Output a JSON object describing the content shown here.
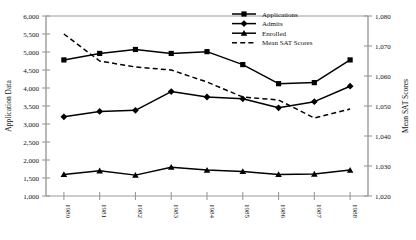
{
  "chart_data": {
    "type": "line",
    "title": "",
    "xlabel": "",
    "ylabel": "Application Data",
    "y2label": "Mean SAT Scores",
    "grid": false,
    "legend_position": "top-right",
    "categories": [
      "1980",
      "1981",
      "1982",
      "1983",
      "1984",
      "1985",
      "1986",
      "1987",
      "1988"
    ],
    "ylim": [
      1000,
      6000
    ],
    "y_ticks": [
      "1,000",
      "1,500",
      "2,000",
      "2,500",
      "3,000",
      "3,500",
      "4,000",
      "4,500",
      "5,000",
      "5,500",
      "6,000"
    ],
    "y_tick_values": [
      1000,
      1500,
      2000,
      2500,
      3000,
      3500,
      4000,
      4500,
      5000,
      5500,
      6000
    ],
    "y2lim": [
      1020,
      1080
    ],
    "y2_ticks": [
      "1,020",
      "1,030",
      "1,040",
      "1,050",
      "1,060",
      "1,070",
      "1,080"
    ],
    "y2_tick_values": [
      1020,
      1030,
      1040,
      1050,
      1060,
      1070,
      1080
    ],
    "series": [
      {
        "name": "Applications",
        "axis": "left",
        "marker": "square",
        "dash": false,
        "color": "#000000",
        "values": [
          4780,
          4960,
          5070,
          4960,
          5010,
          4650,
          4120,
          4150,
          4780
        ]
      },
      {
        "name": "Admits",
        "axis": "left",
        "marker": "diamond",
        "dash": false,
        "color": "#000000",
        "values": [
          3200,
          3350,
          3380,
          3900,
          3750,
          3700,
          3450,
          3620,
          4050
        ]
      },
      {
        "name": "Enrolled",
        "axis": "left",
        "marker": "triangle",
        "dash": false,
        "color": "#000000",
        "values": [
          1600,
          1700,
          1580,
          1800,
          1720,
          1680,
          1600,
          1610,
          1720
        ]
      },
      {
        "name": "Mean SAT Scores",
        "axis": "right",
        "marker": "none",
        "dash": true,
        "color": "#000000",
        "values": [
          1074,
          1065,
          1063,
          1062,
          1058,
          1053,
          1052,
          1046,
          1049
        ]
      }
    ]
  },
  "legend": {
    "items": [
      {
        "label": "Applications"
      },
      {
        "label": "Admits"
      },
      {
        "label": "Enrolled"
      },
      {
        "label": "Mean SAT Scores"
      }
    ]
  },
  "axes": {
    "left_title": "Application Data",
    "right_title": "Mean SAT Scores"
  },
  "colors": {
    "ink": "#000000",
    "axis": "#9a9a9a",
    "background": "#ffffff"
  }
}
